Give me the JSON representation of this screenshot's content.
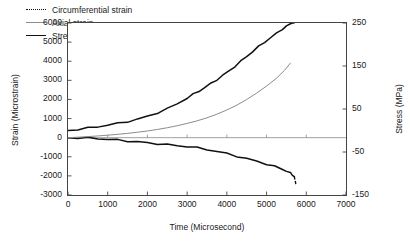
{
  "chart_data": {
    "type": "line",
    "title": "",
    "xlabel": "Time (Microsecond)",
    "ylabel": "Strain (Microstrain)",
    "y2label": "Stress (MPa)",
    "xlim": [
      0,
      7000
    ],
    "ylim": [
      -3000,
      6000
    ],
    "y2lim": [
      -150,
      250
    ],
    "grid": false,
    "legend_position": "top-left inside",
    "xticks": [
      "0",
      "1000",
      "2000",
      "3000",
      "4000",
      "5000",
      "6000",
      "7000"
    ],
    "xtick_values": [
      0,
      1000,
      2000,
      3000,
      4000,
      5000,
      6000,
      7000
    ],
    "yticks": [
      "6000",
      "5000",
      "4000",
      "3000",
      "2000",
      "1000",
      "0",
      "-1000",
      "-2000",
      "-3000"
    ],
    "ytick_values": [
      6000,
      5000,
      4000,
      3000,
      2000,
      1000,
      0,
      -1000,
      -2000,
      -3000
    ],
    "y2ticks": [
      "250",
      "150",
      "50",
      "-50",
      "-150"
    ],
    "y2tick_values": [
      250,
      150,
      50,
      -50,
      -150
    ],
    "series": [
      {
        "name": "Circumferential strain",
        "style": "dotted",
        "color": "#111111",
        "axis": "left",
        "x": [
          0,
          250,
          500,
          750,
          1000,
          1250,
          1500,
          1750,
          2000,
          2250,
          2500,
          2750,
          3000,
          3250,
          3500,
          3750,
          4000,
          4250,
          4500,
          4750,
          5000,
          5200,
          5400,
          5500,
          5600,
          5650,
          5700
        ],
        "y": [
          0,
          -20,
          -45,
          -70,
          -100,
          -130,
          -165,
          -205,
          -250,
          -300,
          -355,
          -415,
          -480,
          -555,
          -640,
          -735,
          -840,
          -955,
          -1080,
          -1215,
          -1365,
          -1500,
          -1660,
          -1760,
          -1880,
          -1960,
          -2060
        ]
      },
      {
        "name": "Axial strain",
        "style": "solid",
        "color": "#8c8c8c",
        "axis": "left",
        "x": [
          0,
          250,
          500,
          750,
          1000,
          1250,
          1500,
          1750,
          2000,
          2250,
          2500,
          2750,
          3000,
          3250,
          3500,
          3750,
          4000,
          4250,
          4500,
          4750,
          5000,
          5250,
          5450,
          5600
        ],
        "y": [
          0,
          25,
          55,
          90,
          130,
          175,
          225,
          285,
          350,
          430,
          520,
          625,
          745,
          880,
          1040,
          1230,
          1450,
          1700,
          2000,
          2330,
          2700,
          3110,
          3520,
          3900
        ]
      },
      {
        "name": "Stress",
        "style": "solid",
        "color": "#111111",
        "axis": "right",
        "x": [
          0,
          250,
          500,
          750,
          1000,
          1250,
          1500,
          1750,
          2000,
          2250,
          2500,
          2750,
          3000,
          3150,
          3300,
          3450,
          3600,
          3750,
          3900,
          4050,
          4200,
          4350,
          4500,
          4650,
          4800,
          4950,
          5100,
          5250,
          5400,
          5500,
          5600,
          5660,
          5700
        ],
        "y": [
          0,
          2,
          5,
          8,
          12,
          16,
          21,
          27,
          34,
          42,
          51,
          62,
          75,
          83,
          91,
          100,
          109,
          119,
          129,
          139,
          150,
          161,
          172,
          183,
          194,
          205,
          215,
          226,
          237,
          243,
          249,
          252,
          249
        ]
      }
    ]
  },
  "legend": {
    "items": [
      {
        "label": "Circumferential strain",
        "key": "dotted-line-key"
      },
      {
        "label": "Axial strain",
        "key": "gray-line-key"
      },
      {
        "label": "Stress",
        "key": "solid-line-key"
      }
    ]
  }
}
